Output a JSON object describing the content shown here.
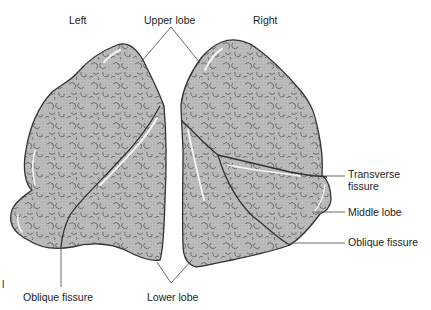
{
  "diagram": {
    "labels": {
      "left": "Left",
      "right": "Right",
      "upper_lobe": "Upper lobe",
      "lower_lobe": "Lower lobe",
      "middle_lobe": "Middle lobe",
      "transverse_fissure_line1": "Transverse",
      "transverse_fissure_line2": "fissure",
      "oblique_fissure_right": "Oblique fissure",
      "oblique_fissure_left": "Oblique fissure",
      "margin_mark": "l"
    },
    "colors": {
      "lung_fill": "#b9b9b9",
      "outline": "#333333",
      "leader": "#444444",
      "texture": "#3a3a3a",
      "highlight": "#f2f2f2"
    }
  }
}
